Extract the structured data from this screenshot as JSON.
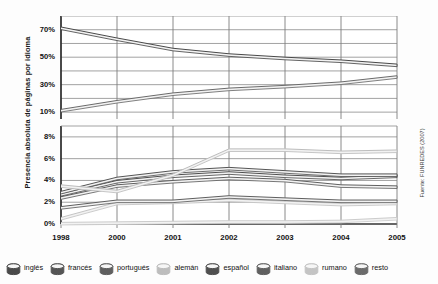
{
  "axis_title": "Presencia absoluta de páginas por idioma",
  "source_note": "Fuente: FUNREDES (2007)",
  "upper_ticks": [
    "70%",
    "50%",
    "30%",
    "10%"
  ],
  "lower_ticks": [
    "8%",
    "6%",
    "4%",
    "2%",
    "0%"
  ],
  "legend": {
    "items": [
      {
        "label": "inglés",
        "color": "#4a4a4a"
      },
      {
        "label": "francés",
        "color": "#555555"
      },
      {
        "label": "portugués",
        "color": "#5f5f5f"
      },
      {
        "label": "alemán",
        "color": "#bdbdbd"
      },
      {
        "label": "español",
        "color": "#4f4f4f"
      },
      {
        "label": "italiano",
        "color": "#606060"
      },
      {
        "label": "rumano",
        "color": "#c4c4c4"
      },
      {
        "label": "resto",
        "color": "#6b6b6b"
      }
    ]
  },
  "chart_data": {
    "type": "line",
    "title": "",
    "xlabel": "",
    "ylabel": "Presencia absoluta de páginas por idioma",
    "x": [
      1998,
      2000,
      2001,
      2002,
      2003,
      2004,
      2005
    ],
    "grid": true,
    "legend_position": "bottom",
    "broken_axis": true,
    "panels": [
      {
        "name": "upper",
        "ylim": [
          5,
          80
        ],
        "yticks": [
          10,
          20,
          30,
          40,
          50,
          60,
          70
        ],
        "ytick_labels": [
          "10%",
          "",
          "30%",
          "",
          "50%",
          "",
          "70%"
        ],
        "series": [
          {
            "name": "inglés",
            "color": "#4a4a4a",
            "values": [
              72.0,
              64.0,
              56.5,
              52.5,
              50.0,
              48.0,
              45.0
            ]
          },
          {
            "name": "resto",
            "color": "#6b6b6b",
            "values": [
              12.0,
              18.5,
              24.0,
              27.5,
              29.5,
              32.0,
              36.5
            ]
          }
        ]
      },
      {
        "name": "lower",
        "ylim": [
          0,
          9
        ],
        "yticks": [
          0,
          2,
          4,
          6,
          8
        ],
        "ytick_labels": [
          "0%",
          "2%",
          "4%",
          "6%",
          "8%"
        ],
        "series": [
          {
            "name": "alemán",
            "color": "#bdbdbd",
            "values": [
              3.6,
              3.1,
              4.6,
              6.9,
              6.9,
              6.7,
              6.8
            ]
          },
          {
            "name": "francés",
            "color": "#555555",
            "values": [
              3.0,
              4.3,
              4.9,
              5.2,
              4.9,
              4.6,
              4.6
            ]
          },
          {
            "name": "español",
            "color": "#4f4f4f",
            "values": [
              2.8,
              4.0,
              4.5,
              4.8,
              4.5,
              4.3,
              4.5
            ]
          },
          {
            "name": "italiano",
            "color": "#606060",
            "values": [
              2.5,
              3.6,
              4.0,
              4.3,
              4.1,
              3.6,
              3.5
            ]
          },
          {
            "name": "portugués",
            "color": "#5f5f5f",
            "values": [
              1.6,
              2.2,
              2.2,
              2.6,
              2.4,
              2.2,
              2.2
            ]
          },
          {
            "name": "rumano",
            "color": "#c4c4c4",
            "values": [
              0.6,
              2.0,
              2.1,
              2.3,
              2.1,
              1.9,
              2.0
            ]
          },
          {
            "name": "resto-baja",
            "color": "#cccccc",
            "values": [
              0.15,
              0.2,
              0.25,
              0.3,
              0.3,
              0.35,
              0.6
            ]
          }
        ]
      }
    ]
  }
}
